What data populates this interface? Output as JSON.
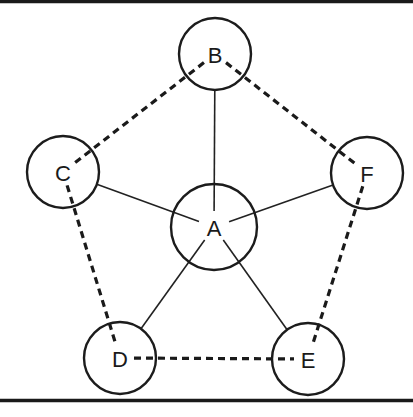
{
  "diagram": {
    "type": "graph",
    "width": 413,
    "height": 417,
    "colors": {
      "background": "#ffffff",
      "stroke": "#1c1c1c"
    },
    "borders": {
      "top_y": 1.5,
      "bottom_y": 400.5
    },
    "nodes": [
      {
        "id": "A",
        "label": "A",
        "cx": 214,
        "cy": 227,
        "r": 43
      },
      {
        "id": "B",
        "label": "B",
        "cx": 215,
        "cy": 54,
        "r": 36
      },
      {
        "id": "C",
        "label": "C",
        "cx": 63,
        "cy": 172,
        "r": 36
      },
      {
        "id": "F",
        "label": "F",
        "cx": 367,
        "cy": 173,
        "r": 36
      },
      {
        "id": "D",
        "label": "D",
        "cx": 120,
        "cy": 358,
        "r": 36
      },
      {
        "id": "E",
        "label": "E",
        "cx": 308,
        "cy": 359,
        "r": 36
      }
    ],
    "edges_solid": [
      {
        "from": "A",
        "to": "B"
      },
      {
        "from": "A",
        "to": "C"
      },
      {
        "from": "A",
        "to": "F"
      },
      {
        "from": "A",
        "to": "D"
      },
      {
        "from": "A",
        "to": "E"
      }
    ],
    "edges_dashed": [
      {
        "from": "B",
        "to": "C"
      },
      {
        "from": "B",
        "to": "F"
      },
      {
        "from": "C",
        "to": "D"
      },
      {
        "from": "F",
        "to": "E"
      },
      {
        "from": "D",
        "to": "E"
      }
    ]
  }
}
